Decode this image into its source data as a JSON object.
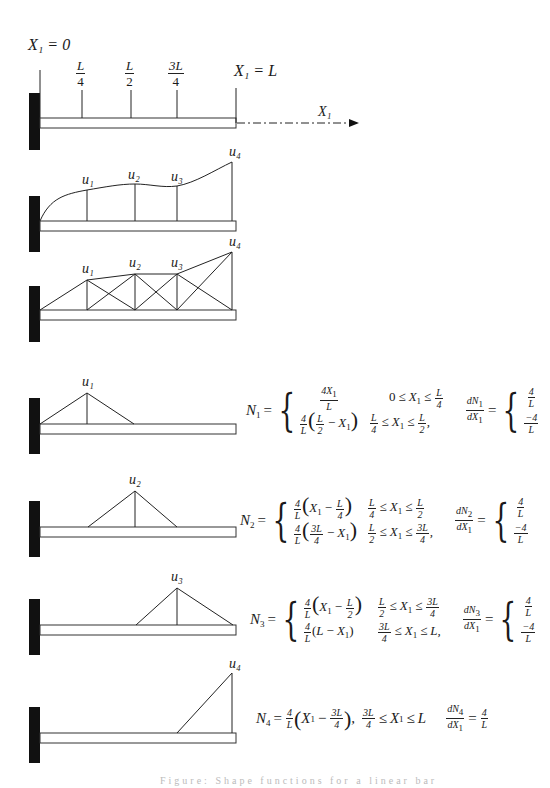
{
  "figure": {
    "top_labels": {
      "x1_zero": "X₁ = 0",
      "x1_L": "X₁ = L",
      "axis_label": "X₁",
      "tick_labels": [
        {
          "num": "L",
          "den": "4"
        },
        {
          "num": "L",
          "den": "2"
        },
        {
          "num": "3L",
          "den": "4"
        }
      ]
    },
    "node_labels": [
      "u₁",
      "u₂",
      "u₃",
      "u₄"
    ],
    "diagrams": [
      {
        "name": "beam-axis",
        "description": "Cantilever beam with quarter-point stations"
      },
      {
        "name": "continuous-displacement",
        "description": "Smooth displacement curve through u1..u4"
      },
      {
        "name": "piecewise-linear-approximation",
        "description": "Truss of hat functions approximating displacement"
      },
      {
        "name": "shape-function-N1",
        "peak": "u₁"
      },
      {
        "name": "shape-function-N2",
        "peak": "u₂"
      },
      {
        "name": "shape-function-N3",
        "peak": "u₃"
      },
      {
        "name": "shape-function-N4",
        "peak": "u₄"
      }
    ]
  },
  "equations": {
    "N1": {
      "lhs": "N",
      "lhs_sub": "1",
      "cases": [
        {
          "expr": "4X₁ / L",
          "cond": "0 ≤ X₁ ≤ L/4"
        },
        {
          "expr": "4/L (L/2 − X₁)",
          "cond": "L/4 ≤ X₁ ≤ L/2,"
        }
      ],
      "derivative": {
        "lhs": "dN₁/dX₁",
        "cases": [
          "4/L",
          "−4/L"
        ]
      }
    },
    "N2": {
      "lhs": "N",
      "lhs_sub": "2",
      "cases": [
        {
          "expr": "4/L (X₁ − L/4)",
          "cond": "L/4 ≤ X₁ ≤ L/2"
        },
        {
          "expr": "4/L (3L/4 − X₁)",
          "cond": "L/2 ≤ X₁ ≤ 3L/4,"
        }
      ],
      "derivative": {
        "lhs": "dN₂/dX₁",
        "cases": [
          "4/L",
          "−4/L"
        ]
      }
    },
    "N3": {
      "lhs": "N",
      "lhs_sub": "3",
      "cases": [
        {
          "expr": "4/L (X₁ − L/2)",
          "cond": "L/2 ≤ X₁ ≤ 3L/4"
        },
        {
          "expr": "4/L (L − X₁)",
          "cond": "3L/4 ≤ X₁ ≤ L,"
        }
      ],
      "derivative": {
        "lhs": "dN₃/dX₁",
        "cases": [
          "4/L",
          "−4/L"
        ]
      }
    },
    "N4": {
      "lhs": "N",
      "lhs_sub": "4",
      "expr": "4/L (X₁ − 3L/4),",
      "cond": "3L/4 ≤ X₁ ≤ L",
      "derivative": {
        "lhs": "dN₄/dX₁",
        "value": "4/L"
      }
    }
  },
  "text": {
    "eq": "=",
    "L": "L",
    "four": "4",
    "neg_four": "−4",
    "two": "2",
    "threeL": "3L",
    "X": "X",
    "sub1": "1",
    "minus": "−",
    "le": "≤",
    "comma": ",",
    "zero": "0",
    "d": "d",
    "N": "N",
    "four_X": "4X"
  },
  "caption": "Figure: Shape functions for a linear bar"
}
